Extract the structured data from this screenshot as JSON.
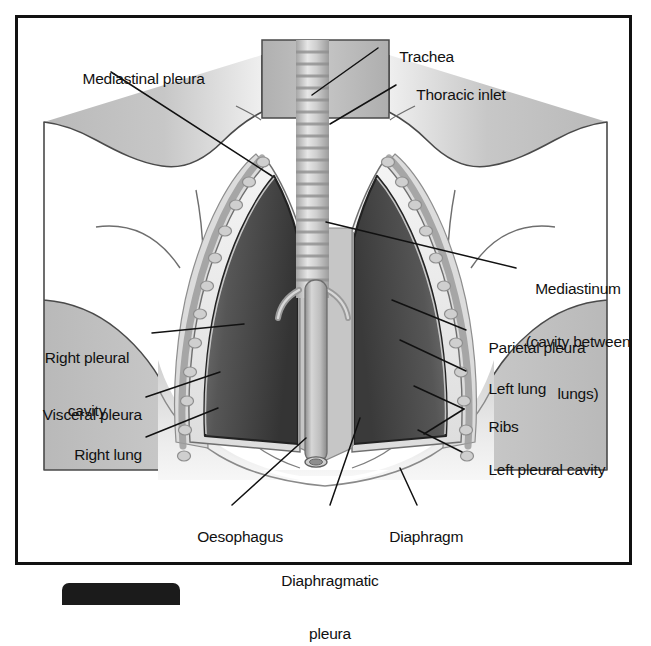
{
  "figure": {
    "border_color": "#111111",
    "background": "#ffffff"
  },
  "palette": {
    "outline": "#3a3a3a",
    "body_fill_light": "#e9e9e9",
    "body_fill_mid": "#b6b6b6",
    "lung_dark": "#4a4a4a",
    "lung_darker": "#2f2f2f",
    "pleura_light": "#f2f2f2",
    "rib_fill": "#c9c9c9",
    "trachea_band": "#9a9a9a",
    "leader_line": "#111111",
    "diaphragm_fill": "#dcdcdc"
  },
  "labels": [
    {
      "id": "trachea",
      "text": "Trachea",
      "align": "left",
      "lines": 1
    },
    {
      "id": "mediastinal-pleura",
      "text": "Mediastinal pleura",
      "align": "left",
      "lines": 1
    },
    {
      "id": "thoracic-inlet",
      "text": "Thoracic inlet",
      "align": "left",
      "lines": 1
    },
    {
      "id": "mediastinum",
      "text": "Mediastinum\n(cavity between\nlungs)",
      "align": "center",
      "lines": 3
    },
    {
      "id": "parietal-pleura",
      "text": "Parietal pleura",
      "align": "left",
      "lines": 1
    },
    {
      "id": "left-lung",
      "text": "Left lung",
      "align": "left",
      "lines": 1
    },
    {
      "id": "ribs",
      "text": "Ribs",
      "align": "left",
      "lines": 1
    },
    {
      "id": "left-pleural-cavity",
      "text": "Left pleural cavity",
      "align": "left",
      "lines": 1
    },
    {
      "id": "right-pleural-cavity",
      "text": "Right pleural\ncavity",
      "align": "center",
      "lines": 2
    },
    {
      "id": "visceral-pleura",
      "text": "Visceral pleura",
      "align": "right",
      "lines": 1
    },
    {
      "id": "right-lung",
      "text": "Right lung",
      "align": "right",
      "lines": 1
    },
    {
      "id": "oesophagus",
      "text": "Oesophagus",
      "align": "center",
      "lines": 1
    },
    {
      "id": "diaphragmatic-pleura",
      "text": "Diaphragmatic\npleura",
      "align": "center",
      "lines": 2
    },
    {
      "id": "diaphragm",
      "text": "Diaphragm",
      "align": "center",
      "lines": 1
    }
  ],
  "label_text": {
    "trachea": "Trachea",
    "mediastinal_pleura": "Mediastinal pleura",
    "thoracic_inlet": "Thoracic inlet",
    "mediastinum_l1": "Mediastinum",
    "mediastinum_l2": "(cavity between",
    "mediastinum_l3": "lungs)",
    "parietal_pleura": "Parietal pleura",
    "left_lung": "Left lung",
    "ribs": "Ribs",
    "left_pleural_cavity": "Left pleural cavity",
    "right_pleural_cavity_l1": "Right pleural",
    "right_pleural_cavity_l2": "cavity",
    "visceral_pleura": "Visceral pleura",
    "right_lung": "Right lung",
    "oesophagus": "Oesophagus",
    "diaphragmatic_pleura_l1": "Diaphragmatic",
    "diaphragmatic_pleura_l2": "pleura",
    "diaphragm": "Diaphragm"
  }
}
